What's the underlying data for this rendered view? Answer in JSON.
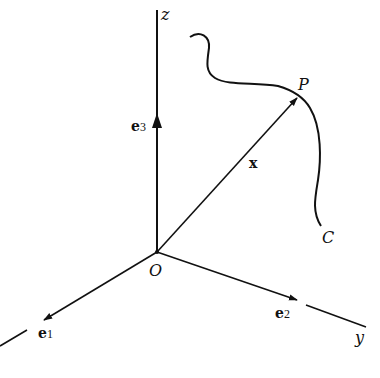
{
  "diagram": {
    "colors": {
      "ink": "#111111",
      "background": "#ffffff"
    },
    "origin": {
      "label": "O",
      "pos": [
        157,
        252
      ]
    },
    "axes": [
      {
        "id": "z",
        "label": "z",
        "basis_label": "e",
        "basis_sub": "3"
      },
      {
        "id": "x1",
        "label": "",
        "basis_label": "e",
        "basis_sub": "1"
      },
      {
        "id": "y",
        "label": "y",
        "basis_label": "e",
        "basis_sub": "2"
      }
    ],
    "vector": {
      "label": "x",
      "from": "O",
      "to": "P"
    },
    "point": {
      "label": "P",
      "pos": [
        298,
        97
      ]
    },
    "curve": {
      "label": "C"
    }
  }
}
